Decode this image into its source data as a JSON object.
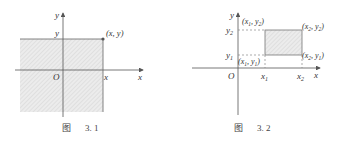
{
  "figures": [
    {
      "id": "fig-3-1",
      "caption": {
        "prefix": "图",
        "number": "3. 1"
      },
      "axis_labels": {
        "x": "x",
        "y": "y",
        "origin": "O"
      },
      "tick_labels": {
        "x": "x",
        "y": "y"
      },
      "point_label": "(x, y)",
      "description": "Shaded quadrant region to the lower-left of point (x, y)"
    },
    {
      "id": "fig-3-2",
      "caption": {
        "prefix": "图",
        "number": "3. 2"
      },
      "axis_labels": {
        "x": "x",
        "y": "y",
        "origin": "O"
      },
      "tick_labels": {
        "x1": "x",
        "x1_sub": "1",
        "x2": "x",
        "x2_sub": "2",
        "y1": "y",
        "y1_sub": "1",
        "y2": "y",
        "y2_sub": "2"
      },
      "corner_labels": {
        "top_left": {
          "a": "x",
          "a_sub": "1",
          "b": "y",
          "b_sub": "2"
        },
        "top_right": {
          "a": "x",
          "a_sub": "2",
          "b": "y",
          "b_sub": "2"
        },
        "bottom_left": {
          "a": "x",
          "a_sub": "1",
          "b": "y",
          "b_sub": "1"
        },
        "bottom_right": {
          "a": "x",
          "a_sub": "2",
          "b": "y",
          "b_sub": "1"
        }
      },
      "description": "Shaded rectangle with corners (x1,y1), (x2,y2)"
    }
  ],
  "colors": {
    "axis": "#555555",
    "shade": "#e6e6e6",
    "hatch": "#cfcfcf",
    "dash": "#888888"
  }
}
